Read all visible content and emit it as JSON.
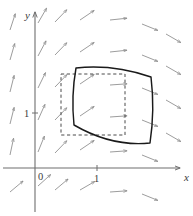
{
  "figure": {
    "background_color": "#ffffff",
    "axis_color": "#6e6e6e",
    "arrow_color": "#8a8a8a",
    "solid_shape_color": "#1a1a1a",
    "dashed_shape_color": "#4a4a4a",
    "label_color": "#3a3a3a"
  },
  "axes": {
    "x_axis": {
      "name": "x-axis",
      "label": "x",
      "label_x": 184,
      "label_y": 181,
      "origin_y": 168,
      "start_x": 3,
      "end_x": 180
    },
    "y_axis": {
      "name": "y-axis",
      "label": "y",
      "label_x": 25,
      "label_y": 19,
      "origin_x": 35,
      "start_y": 212,
      "end_y": 12
    },
    "origin_label": {
      "text": "0",
      "x": 38,
      "y": 180
    },
    "ticks": [
      {
        "axis": "x",
        "text": "1",
        "value": 1,
        "label_x": 94,
        "label_y": 182,
        "tick_x": 97,
        "tick_y": 168
      },
      {
        "axis": "y",
        "text": "1",
        "value": 1,
        "label_x": 24,
        "label_y": 117,
        "tick_x": 35,
        "tick_y": 113
      }
    ]
  },
  "chart_data": {
    "type": "scatter",
    "xlabel": "x",
    "ylabel": "y",
    "xlim": [
      -0.55,
      2.35
    ],
    "ylim": [
      -0.55,
      2.85
    ],
    "grid": false,
    "legend": null,
    "annotations": [
      "0",
      "1",
      "1",
      "x",
      "y"
    ],
    "dashed_region": {
      "name": "original-square-region",
      "style": "dashed",
      "corners_px": [
        [
          61,
          74
        ],
        [
          125,
          74
        ],
        [
          125,
          135
        ],
        [
          61,
          135
        ]
      ]
    },
    "solid_region": {
      "name": "deformed-region",
      "style": "solid",
      "corners_px": [
        [
          76,
          68
        ],
        [
          151,
          77
        ],
        [
          150,
          143
        ],
        [
          74,
          125
        ]
      ],
      "edges": [
        {
          "from": [
            76,
            68
          ],
          "to": [
            151,
            77
          ],
          "curve_ctrl": [
            113,
            64
          ]
        },
        {
          "from": [
            151,
            77
          ],
          "to": [
            150,
            143
          ],
          "curve_ctrl": [
            155,
            110
          ]
        },
        {
          "from": [
            150,
            143
          ],
          "to": [
            74,
            125
          ],
          "curve_ctrl": [
            112,
            147
          ]
        },
        {
          "from": [
            74,
            125
          ],
          "to": [
            76,
            68
          ],
          "curve_ctrl": [
            71,
            96
          ]
        }
      ]
    },
    "vector_field": {
      "description": "arrows rotate clockwise with increasing x: near-vertical at left, diagonal up-right in the middle, horizontal to the right near x=1.4, tilting down-right at far right",
      "arrow_length_px": 17,
      "arrows": [
        {
          "x": 10,
          "y": 30,
          "angle": -72
        },
        {
          "x": 10,
          "y": 60,
          "angle": -74
        },
        {
          "x": 10,
          "y": 92,
          "angle": -76
        },
        {
          "x": 10,
          "y": 124,
          "angle": -76
        },
        {
          "x": 10,
          "y": 155,
          "angle": -78
        },
        {
          "x": 10,
          "y": 192,
          "angle": -40
        },
        {
          "x": 38,
          "y": 23,
          "angle": -60
        },
        {
          "x": 38,
          "y": 56,
          "angle": -62
        },
        {
          "x": 38,
          "y": 88,
          "angle": -64
        },
        {
          "x": 38,
          "y": 120,
          "angle": -66
        },
        {
          "x": 38,
          "y": 152,
          "angle": -68
        },
        {
          "x": 38,
          "y": 186,
          "angle": -42
        },
        {
          "x": 55,
          "y": 22,
          "angle": -46
        },
        {
          "x": 55,
          "y": 55,
          "angle": -46
        },
        {
          "x": 55,
          "y": 87,
          "angle": -46
        },
        {
          "x": 55,
          "y": 120,
          "angle": -46
        },
        {
          "x": 55,
          "y": 153,
          "angle": -46
        },
        {
          "x": 55,
          "y": 190,
          "angle": -40
        },
        {
          "x": 80,
          "y": 20,
          "angle": -34
        },
        {
          "x": 80,
          "y": 52,
          "angle": -34
        },
        {
          "x": 80,
          "y": 84,
          "angle": -34
        },
        {
          "x": 80,
          "y": 116,
          "angle": -34
        },
        {
          "x": 80,
          "y": 150,
          "angle": -34
        },
        {
          "x": 80,
          "y": 190,
          "angle": -30
        },
        {
          "x": 110,
          "y": 20,
          "angle": -6
        },
        {
          "x": 110,
          "y": 52,
          "angle": -6
        },
        {
          "x": 110,
          "y": 85,
          "angle": -4
        },
        {
          "x": 110,
          "y": 117,
          "angle": -4
        },
        {
          "x": 110,
          "y": 152,
          "angle": -4
        },
        {
          "x": 110,
          "y": 192,
          "angle": -4
        },
        {
          "x": 142,
          "y": 24,
          "angle": 22
        },
        {
          "x": 142,
          "y": 55,
          "angle": 22
        },
        {
          "x": 142,
          "y": 88,
          "angle": 22
        },
        {
          "x": 142,
          "y": 120,
          "angle": 22
        },
        {
          "x": 142,
          "y": 155,
          "angle": 22
        },
        {
          "x": 142,
          "y": 194,
          "angle": 22
        },
        {
          "x": 166,
          "y": 34,
          "angle": 30
        },
        {
          "x": 166,
          "y": 66,
          "angle": 30
        },
        {
          "x": 166,
          "y": 100,
          "angle": 30
        },
        {
          "x": 166,
          "y": 133,
          "angle": 30
        }
      ]
    }
  }
}
